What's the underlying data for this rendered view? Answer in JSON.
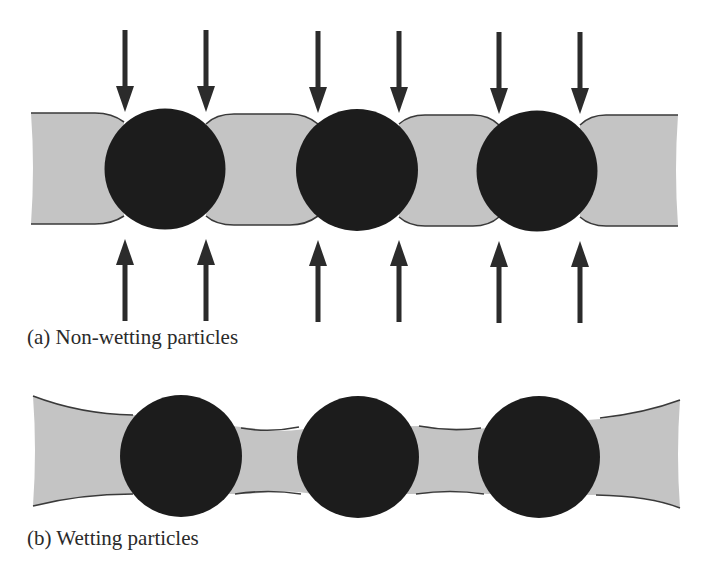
{
  "figure": {
    "colors": {
      "background": "#ffffff",
      "liquid_fill": "#c4c4c4",
      "liquid_outline": "#3a3a3a",
      "particle": "#1c1c1c",
      "arrow": "#2b2b2b",
      "caption_text": "#2a2a2a"
    },
    "panels": [
      {
        "id": "a",
        "caption": "(a) Non-wetting particles",
        "particle_count": 3,
        "arrows_down_count": 6,
        "arrows_up_count": 6,
        "description": "Non-wetting particles in liquid film: liquid bridges bulge convexly, compressive arrows at particle contact lines from above and below"
      },
      {
        "id": "b",
        "caption": "(b) Wetting particles",
        "particle_count": 3,
        "arrows_down_count": 0,
        "arrows_up_count": 0,
        "description": "Wetting particles in liquid film: liquid film thins concavely between particles"
      }
    ]
  }
}
